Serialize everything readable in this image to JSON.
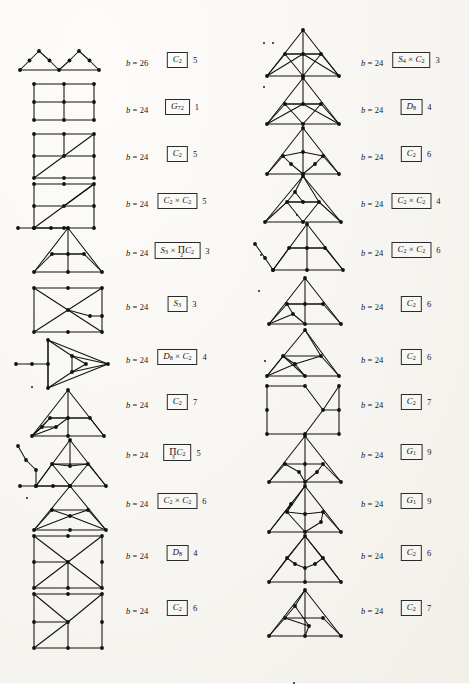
{
  "page": {
    "kind": "graph-table",
    "columns": 2,
    "rows_per_column": 12,
    "b_prefix": "b ="
  },
  "left_column": [
    {
      "b": "26",
      "group": "C2",
      "count": "5",
      "fig": "two-triangles-path"
    },
    {
      "b": "24",
      "group": "G72",
      "count": "1",
      "fig": "grid-3x3"
    },
    {
      "b": "24",
      "group": "C2",
      "count": "5",
      "fig": "grid-diag-a"
    },
    {
      "b": "24",
      "group": "C2xC2",
      "count": "5",
      "fig": "grid-diag-b"
    },
    {
      "b": "24",
      "group": "S3xPi2C2",
      "count": "3",
      "fig": "triangle-nested-tail"
    },
    {
      "b": "24",
      "group": "S3",
      "count": "3",
      "fig": "box-cross"
    },
    {
      "b": "24",
      "group": "D8xC2",
      "count": "4",
      "fig": "arrow-triangle-tail"
    },
    {
      "b": "24",
      "group": "C2",
      "count": "7",
      "fig": "triangle-inner-fan"
    },
    {
      "b": "24",
      "group": "Pi3C2",
      "count": "5",
      "fig": "triangle-zigzag-tail"
    },
    {
      "b": "24",
      "group": "C2xC2",
      "count": "6",
      "fig": "triangle-butterfly-tail"
    },
    {
      "b": "24",
      "group": "D8",
      "count": "4",
      "fig": "square-long-diag"
    },
    {
      "b": "24",
      "group": "C2",
      "count": "6",
      "fig": "square-fan"
    }
  ],
  "right_column": [
    {
      "b": "24",
      "group": "S4xC2",
      "count": "3",
      "fig": "triangle-full-wheel"
    },
    {
      "b": "24",
      "group": "D8",
      "count": "4",
      "fig": "triangle-bowtie"
    },
    {
      "b": "24",
      "group": "C2",
      "count": "6",
      "fig": "triangle-double-fan"
    },
    {
      "b": "24",
      "group": "C2xC2",
      "count": "4",
      "fig": "triangle-ladder"
    },
    {
      "b": "24",
      "group": "C2xC2",
      "count": "6",
      "fig": "triangle-tail-left"
    },
    {
      "b": "24",
      "group": "C2",
      "count": "6",
      "fig": "triangle-center-spine"
    },
    {
      "b": "24",
      "group": "C2",
      "count": "6",
      "fig": "triangle-cross-inner"
    },
    {
      "b": "24",
      "group": "C2",
      "count": "7",
      "fig": "square-x-right"
    },
    {
      "b": "24",
      "group": "G1",
      "count": "9",
      "fig": "triangle-spine-stub"
    },
    {
      "b": "24",
      "group": "G1",
      "count": "9",
      "fig": "triangle-arrow-pair"
    },
    {
      "b": "24",
      "group": "C2",
      "count": "6",
      "fig": "triangle-vee-inner"
    },
    {
      "b": "24",
      "group": "C2",
      "count": "7",
      "fig": "triangle-slant-inner"
    }
  ],
  "group_symbols": {
    "C2": {
      "base": "C",
      "sub": "2"
    },
    "C3": {
      "base": "C",
      "sub": "3"
    },
    "G72": {
      "base": "G",
      "sub": "72"
    },
    "G1": {
      "base": "G",
      "sub": "1"
    },
    "D8": {
      "base": "D",
      "sub": "8"
    },
    "S3": {
      "base": "S",
      "sub": "3"
    },
    "S4": {
      "base": "S",
      "sub": "4"
    },
    "C2xC2": {
      "text": "C2 x C2"
    },
    "D8xC2": {
      "text": "D8 x C2"
    },
    "S4xC2": {
      "text": "S4 x C2"
    },
    "S3xPi2C2": {
      "text": "S3 x Pi2 C2"
    },
    "Pi3C2": {
      "text": "Pi3 C2"
    }
  },
  "colors": {
    "ink": "#151515",
    "paper": "#f7f5f1",
    "edge": "#111111"
  }
}
